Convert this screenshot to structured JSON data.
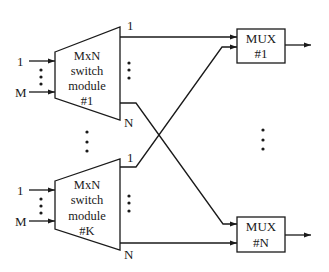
{
  "diagram": {
    "type": "block diagram",
    "modules": [
      {
        "id": "module-1",
        "lines": [
          "MxN",
          "switch",
          "module",
          "#1"
        ],
        "input_first": "1",
        "input_last": "M",
        "output_first": "1",
        "output_last": "N"
      },
      {
        "id": "module-k",
        "lines": [
          "MxN",
          "switch",
          "module",
          "#K"
        ],
        "input_first": "1",
        "input_last": "M",
        "output_first": "1",
        "output_last": "N"
      }
    ],
    "muxes": [
      {
        "id": "mux-1",
        "line1": "MUX",
        "line2": "#1"
      },
      {
        "id": "mux-n",
        "line1": "MUX",
        "line2": "#N"
      }
    ],
    "connections": [
      {
        "from": "module-1.output-1",
        "to": "mux-1.input-top"
      },
      {
        "from": "module-1.output-N",
        "to": "mux-n.input-top"
      },
      {
        "from": "module-k.output-1",
        "to": "mux-1.input-bottom"
      },
      {
        "from": "module-k.output-N",
        "to": "mux-n.input-bottom"
      }
    ],
    "colors": {
      "stroke": "#1a1a1a",
      "background": "#ffffff"
    }
  }
}
